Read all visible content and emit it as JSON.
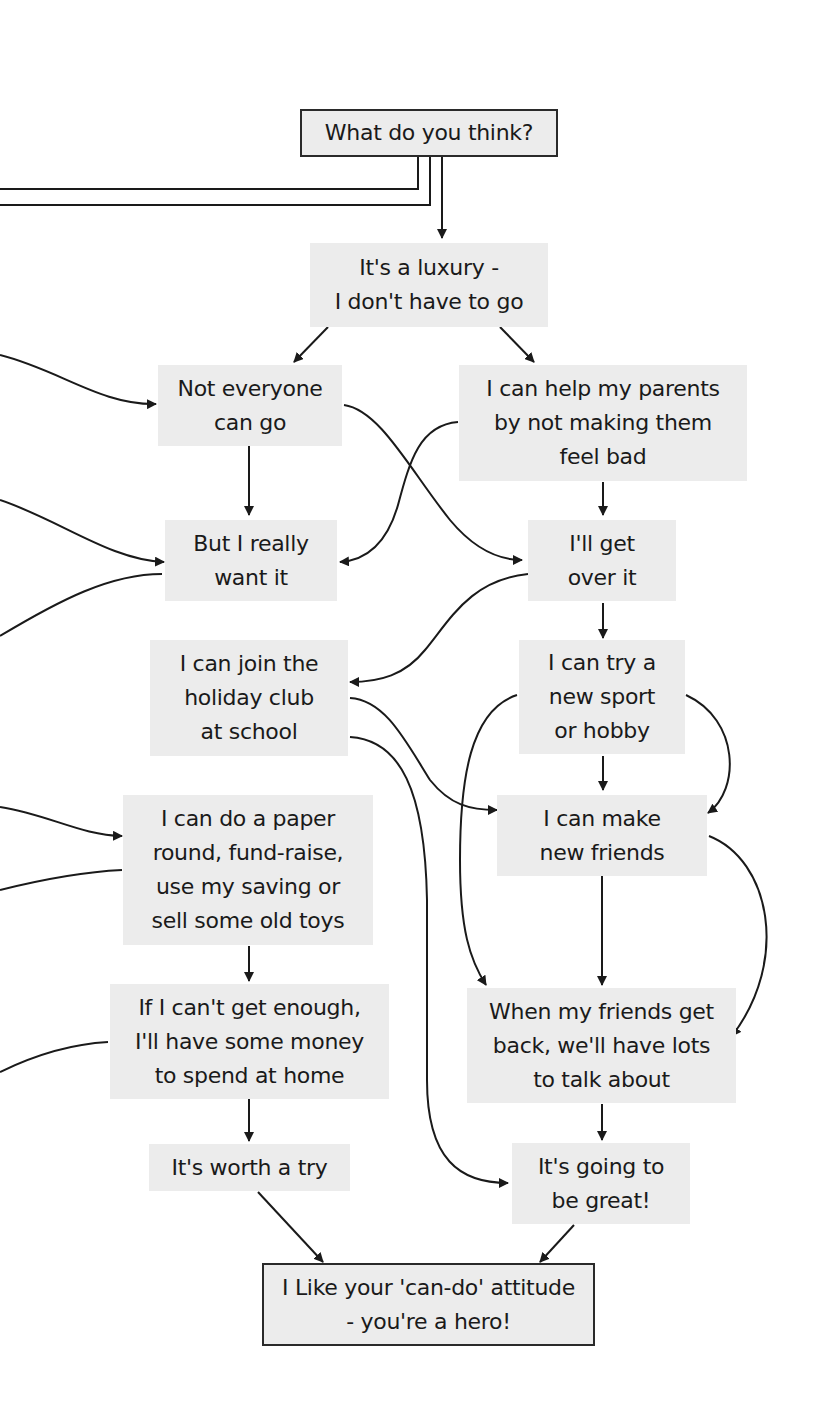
{
  "diagram": {
    "type": "flowchart",
    "colors": {
      "box_fill": "#ececec",
      "line": "#1a1a1a",
      "background": "#ffffff"
    },
    "nodes": {
      "start": {
        "lines": [
          "What do you think?"
        ]
      },
      "luxury": {
        "lines": [
          "It's a luxury -",
          "I don't have to go"
        ]
      },
      "not_everyone": {
        "lines": [
          "Not everyone",
          "can go"
        ]
      },
      "help_parents": {
        "lines": [
          "I can help my parents",
          "by not making them",
          "feel bad"
        ]
      },
      "really_want": {
        "lines": [
          "But I really",
          "want it"
        ]
      },
      "get_over": {
        "lines": [
          "I'll get",
          "over it"
        ]
      },
      "holiday_club": {
        "lines": [
          "I can join the",
          "holiday club",
          "at school"
        ]
      },
      "new_sport": {
        "lines": [
          "I can try a",
          "new sport",
          "or hobby"
        ]
      },
      "make_friends": {
        "lines": [
          "I can make",
          "new friends"
        ]
      },
      "paper_round": {
        "lines": [
          "I can do a paper",
          "round, fund-raise,",
          "use my saving or",
          "sell some old toys"
        ]
      },
      "cant_enough": {
        "lines": [
          "If I can't get enough,",
          "I'll have some money",
          "to spend at home"
        ]
      },
      "talk_about": {
        "lines": [
          "When my friends get",
          "back, we'll have lots",
          "to talk about"
        ]
      },
      "worth_try": {
        "lines": [
          "It's worth a try"
        ]
      },
      "going_great": {
        "lines": [
          "It's going to",
          "be great!"
        ]
      },
      "end": {
        "lines": [
          "I Like your 'can-do' attitude",
          "- you're a hero!"
        ]
      }
    },
    "edges": [
      [
        "start",
        "luxury"
      ],
      [
        "luxury",
        "not_everyone"
      ],
      [
        "luxury",
        "help_parents"
      ],
      [
        "not_everyone",
        "really_want"
      ],
      [
        "not_everyone",
        "get_over"
      ],
      [
        "help_parents",
        "really_want"
      ],
      [
        "help_parents",
        "get_over"
      ],
      [
        "get_over",
        "holiday_club"
      ],
      [
        "get_over",
        "new_sport"
      ],
      [
        "holiday_club",
        "make_friends"
      ],
      [
        "holiday_club",
        "going_great"
      ],
      [
        "new_sport",
        "make_friends"
      ],
      [
        "new_sport",
        "talk_about"
      ],
      [
        "make_friends",
        "talk_about"
      ],
      [
        "paper_round",
        "cant_enough"
      ],
      [
        "cant_enough",
        "worth_try"
      ],
      [
        "talk_about",
        "going_great"
      ],
      [
        "worth_try",
        "end"
      ],
      [
        "going_great",
        "end"
      ]
    ]
  }
}
